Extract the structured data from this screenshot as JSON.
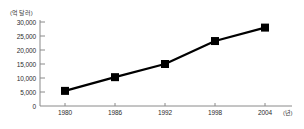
{
  "chart_data": {
    "type": "line",
    "title": "",
    "subtitle": "",
    "xlabel": "(년)",
    "ylabel": "(억 달러)",
    "x": [
      1980,
      1986,
      1992,
      1998,
      2004
    ],
    "categories": [
      "1980",
      "1986",
      "1992",
      "1998",
      "2004"
    ],
    "values": [
      5400,
      10300,
      15000,
      23200,
      28000
    ],
    "series": [
      {
        "name": "",
        "values": [
          5400,
          10300,
          15000,
          23200,
          28000
        ]
      }
    ],
    "ylim": [
      0,
      30000
    ],
    "xlim": [
      1980,
      2004
    ],
    "ytick_labels": [
      "30,000",
      "25,000",
      "20,000",
      "15,000",
      "10,000",
      "5,000",
      "0"
    ],
    "ytick_values": [
      30000,
      25000,
      20000,
      15000,
      10000,
      5000,
      0
    ],
    "xtick_labels": [
      "1980",
      "1986",
      "1992",
      "1998",
      "2004"
    ],
    "xtick_values": [
      1980,
      1986,
      1992,
      1998,
      2004
    ],
    "grid": false,
    "legend": null,
    "marker": "square",
    "line_color": "#000000",
    "marker_color": "#000000",
    "axis_color": "#808080"
  },
  "axis": {
    "y_unit": "(억 달러)",
    "x_unit": "(년)"
  }
}
